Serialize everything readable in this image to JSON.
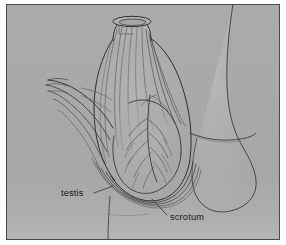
{
  "figure": {
    "type": "anatomical-line-drawing",
    "style": "pen-and-ink line art on flat gray plate",
    "caption_labels": [
      {
        "id": "testis",
        "text": "testis"
      },
      {
        "id": "scrotum",
        "text": "scrotum"
      }
    ]
  },
  "labels": {
    "testis": "testis",
    "scrotum": "scrotum"
  },
  "colors": {
    "page_background": "#ffffff",
    "plate_background": "#a8a8a8",
    "plate_background_light": "#b3b3b3",
    "plate_border": "#4a4a4a",
    "ink": "#2b2b2b",
    "ink_light": "#555555",
    "label_text": "#171717",
    "leader_line": "#333333"
  },
  "plate": {
    "x": 6,
    "y": 4,
    "width": 274,
    "height": 236,
    "border_width": 1
  },
  "annotations": [
    {
      "name": "testis-label",
      "text": "testis",
      "text_x": 61,
      "text_y": 196,
      "leader": {
        "x1": 94,
        "y1": 193,
        "x2": 113,
        "y2": 186
      }
    },
    {
      "name": "scrotum-label",
      "text": "scrotum",
      "text_x": 170,
      "text_y": 220,
      "leader": {
        "x1": 167,
        "y1": 215,
        "x2": 152,
        "y2": 199
      }
    }
  ]
}
